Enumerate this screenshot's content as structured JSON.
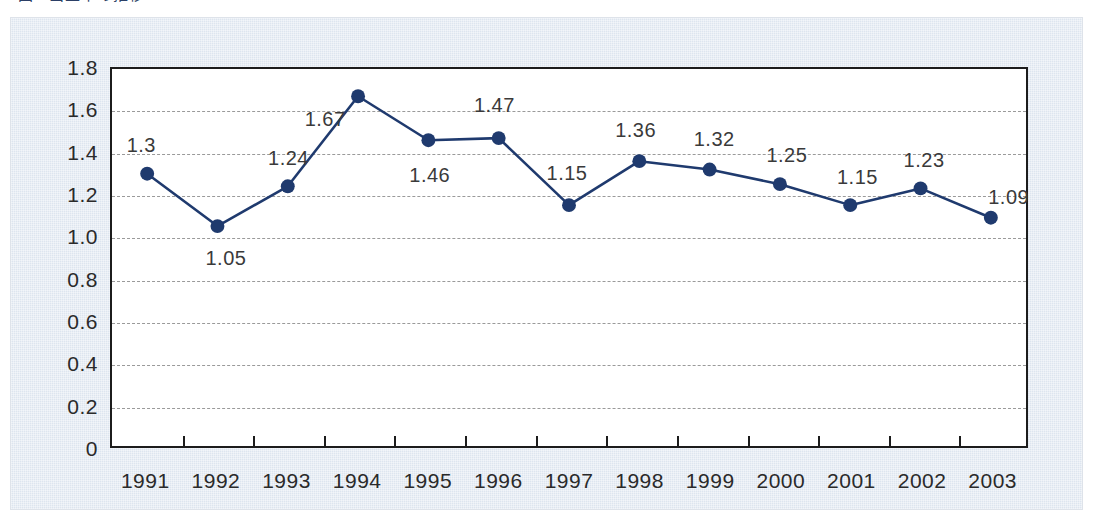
{
  "caption": {
    "sliver_text": "図1 出生率の推移"
  },
  "colors": {
    "panel_bg": "#dde5ef",
    "plot_bg": "#ffffff",
    "axis": "#1c1c1c",
    "series": "#1f3a6e",
    "marker": "#1f3a6e",
    "gridline": "#9a9a9a",
    "label_text": "#2a2a2a"
  },
  "chart_data": {
    "type": "line",
    "title": "",
    "xlabel": "",
    "ylabel": "",
    "categories": [
      "1991",
      "1992",
      "1993",
      "1994",
      "1995",
      "1996",
      "1997",
      "1998",
      "1999",
      "2000",
      "2001",
      "2002",
      "2003"
    ],
    "values": [
      1.3,
      1.05,
      1.24,
      1.67,
      1.46,
      1.47,
      1.15,
      1.36,
      1.32,
      1.25,
      1.15,
      1.23,
      1.09
    ],
    "point_labels": [
      "1.3",
      "1.05",
      "1.24",
      "1.67",
      "1.46",
      "1.47",
      "1.15",
      "1.36",
      "1.32",
      "1.25",
      "1.15",
      "1.23",
      "1.09"
    ],
    "series": [
      {
        "name": "",
        "values": [
          1.3,
          1.05,
          1.24,
          1.67,
          1.46,
          1.47,
          1.15,
          1.36,
          1.32,
          1.25,
          1.15,
          1.23,
          1.09
        ]
      }
    ],
    "ylim": [
      0,
      1.8
    ],
    "yticks": [
      0,
      0.2,
      0.4,
      0.6,
      0.8,
      1.0,
      1.2,
      1.4,
      1.6,
      1.8
    ],
    "ytick_labels": [
      "0",
      "0.2",
      "0.4",
      "0.6",
      "0.8",
      "1.0",
      "1.2",
      "1.4",
      "1.6",
      "1.8"
    ],
    "grid": true,
    "grid_axis": "y",
    "legend": false,
    "legend_position": "none",
    "marker": "circle"
  }
}
